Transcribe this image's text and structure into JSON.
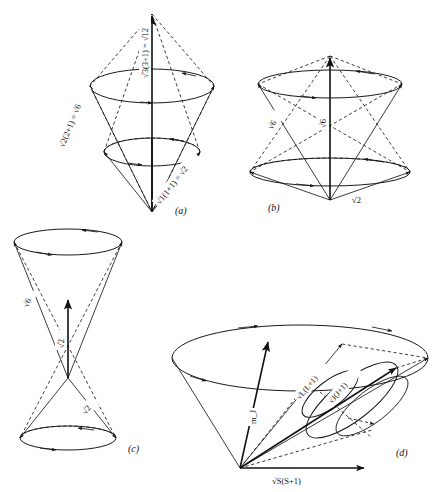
{
  "figure": {
    "title_visible": false,
    "background_color": "#ffffff",
    "ink_color": "#1a1a1a",
    "panels": [
      {
        "id": "a",
        "label": "(a)",
        "description": "two stacked precession cones sharing an apex, vector model for l = 3 and l = 2 and l = 1",
        "labels": [
          {
            "name": "upper-cone-resultant",
            "text": "√3(3+1) = √12"
          },
          {
            "name": "mid-cone-resultant",
            "text": "√2(2+1) = √6"
          },
          {
            "name": "lower-cone-resultant",
            "text": "√1(1+1) = √2"
          }
        ]
      },
      {
        "id": "b",
        "label": "(b)",
        "description": "double cone, apex at bottom, vectors of magnitude root six precessing about the vertical axis",
        "labels": [
          {
            "name": "slant-vector",
            "text": "√6"
          },
          {
            "name": "axis-vector",
            "text": "√6"
          },
          {
            "name": "base-vector",
            "text": "√2"
          }
        ]
      },
      {
        "id": "c",
        "label": "(c)",
        "description": "hourglass pair of cones meeting at a common apex in the middle",
        "labels": [
          {
            "name": "upper-slant-vector",
            "text": "√6"
          },
          {
            "name": "axis-vector",
            "text": "√2"
          },
          {
            "name": "lower-slant-vector",
            "text": "√2"
          }
        ]
      },
      {
        "id": "d",
        "label": "(d)",
        "description": "vector model of spin orbit coupling, L and S precessing about J which precesses about the field axis",
        "labels": [
          {
            "name": "mj-axis-vector",
            "text": "m_J"
          },
          {
            "name": "orbital-vector",
            "text": "√L(L+1)"
          },
          {
            "name": "total-vector",
            "text": "√J(J+1)"
          },
          {
            "name": "spin-vector",
            "text": "√S(S+1)"
          }
        ]
      }
    ]
  }
}
